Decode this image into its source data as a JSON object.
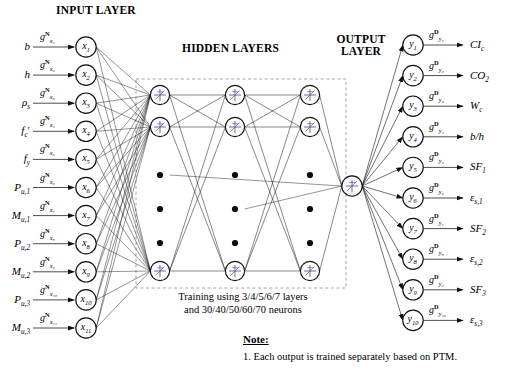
{
  "headers": {
    "input": "INPUT LAYER",
    "hidden": "HIDDEN LAYERS",
    "output_line1": "OUTPUT",
    "output_line2": "LAYER"
  },
  "input_layer": {
    "count": 11,
    "nodes": [
      {
        "node": "x",
        "node_sub": "1",
        "source": "b",
        "source_sub": "",
        "source_prime": false,
        "gain": "g",
        "gain_sup": "N",
        "gain_sub": "x₁"
      },
      {
        "node": "x",
        "node_sub": "2",
        "source": "h",
        "source_sub": "",
        "source_prime": false,
        "gain": "g",
        "gain_sup": "N",
        "gain_sub": "x₂"
      },
      {
        "node": "x",
        "node_sub": "3",
        "source": "ρ",
        "source_sub": "s",
        "source_prime": false,
        "gain": "g",
        "gain_sup": "N",
        "gain_sub": "x₃"
      },
      {
        "node": "x",
        "node_sub": "4",
        "source": "f",
        "source_sub": "c",
        "source_prime": true,
        "gain": "g",
        "gain_sup": "N",
        "gain_sub": "x₄"
      },
      {
        "node": "x",
        "node_sub": "5",
        "source": "f",
        "source_sub": "y",
        "source_prime": false,
        "gain": "g",
        "gain_sup": "N",
        "gain_sub": "x₅"
      },
      {
        "node": "x",
        "node_sub": "6",
        "source": "P",
        "source_sub": "u,1",
        "source_prime": false,
        "gain": "g",
        "gain_sup": "N",
        "gain_sub": "x₆"
      },
      {
        "node": "x",
        "node_sub": "7",
        "source": "M",
        "source_sub": "u,1",
        "source_prime": false,
        "gain": "g",
        "gain_sup": "N",
        "gain_sub": "x₇"
      },
      {
        "node": "x",
        "node_sub": "8",
        "source": "P",
        "source_sub": "u,2",
        "source_prime": false,
        "gain": "g",
        "gain_sup": "N",
        "gain_sub": "x₈"
      },
      {
        "node": "x",
        "node_sub": "9",
        "source": "M",
        "source_sub": "u,2",
        "source_prime": false,
        "gain": "g",
        "gain_sup": "N",
        "gain_sub": "x₉"
      },
      {
        "node": "x",
        "node_sub": "10",
        "source": "P",
        "source_sub": "u,3",
        "source_prime": false,
        "gain": "g",
        "gain_sup": "N",
        "gain_sub": "x₁₀"
      },
      {
        "node": "x",
        "node_sub": "11",
        "source": "M",
        "source_sub": "u,3",
        "source_prime": false,
        "gain": "g",
        "gain_sup": "N",
        "gain_sub": "x₁₁"
      }
    ]
  },
  "hidden_layer": {
    "columns": 3,
    "neurons_per_column_shown": 3,
    "dots_per_column": 3,
    "caption_line1": "Training using 3/4/5/6/7 layers",
    "caption_line2": "and 30/40/50/60/70 neurons"
  },
  "output_layer": {
    "count": 10,
    "nodes": [
      {
        "node": "y",
        "node_sub": "1",
        "target": "CI",
        "target_sub": "c",
        "gain": "g",
        "gain_sup": "D",
        "gain_sub": "y₁"
      },
      {
        "node": "y",
        "node_sub": "2",
        "target": "CO",
        "target_sub": "2",
        "gain": "g",
        "gain_sup": "D",
        "gain_sub": "y₂"
      },
      {
        "node": "y",
        "node_sub": "3",
        "target": "W",
        "target_sub": "c",
        "gain": "g",
        "gain_sup": "D",
        "gain_sub": "y₃"
      },
      {
        "node": "y",
        "node_sub": "4",
        "target": "b/h",
        "target_sub": "",
        "gain": "g",
        "gain_sup": "D",
        "gain_sub": "y₄"
      },
      {
        "node": "y",
        "node_sub": "5",
        "target": "SF",
        "target_sub": "1",
        "gain": "g",
        "gain_sup": "D",
        "gain_sub": "y₅"
      },
      {
        "node": "y",
        "node_sub": "6",
        "target": "ε",
        "target_sub": "s,1",
        "gain": "g",
        "gain_sup": "D",
        "gain_sub": "y₆"
      },
      {
        "node": "y",
        "node_sub": "7",
        "target": "SF",
        "target_sub": "2",
        "gain": "g",
        "gain_sup": "D",
        "gain_sub": "y₇"
      },
      {
        "node": "y",
        "node_sub": "8",
        "target": "ε",
        "target_sub": "s,2",
        "gain": "g",
        "gain_sup": "D",
        "gain_sub": "y₈"
      },
      {
        "node": "y",
        "node_sub": "9",
        "target": "SF",
        "target_sub": "3",
        "gain": "g",
        "gain_sup": "D",
        "gain_sub": "y₉"
      },
      {
        "node": "y",
        "node_sub": "10",
        "target": "ε",
        "target_sub": "s,3",
        "gain": "g",
        "gain_sup": "D",
        "gain_sub": "y₁₀"
      }
    ]
  },
  "note": {
    "title": "Note:",
    "line1": "1. Each output is trained separately based on PTM."
  },
  "colors": {
    "stroke": "#111111",
    "dashed_box": "#9a9a9a",
    "glyph_blue": "#3b4fb5",
    "glyph_red": "#c0392b",
    "background": "#ffffff"
  }
}
